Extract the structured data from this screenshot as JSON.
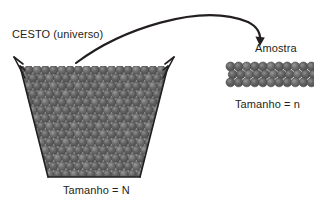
{
  "diagram": {
    "title_basket": "CESTO (universo)",
    "label_basket_size": "Tamanho = N",
    "title_sample": "Amostra",
    "label_sample_size": "Tamanho = n",
    "colors": {
      "background": "#ffffff",
      "outline": "#231f20",
      "text": "#231f20",
      "ball_dark": "#595959",
      "ball_mid": "#6e6e6e",
      "ball_light": "#8a8a8a",
      "ball_edge": "#4a4a4a",
      "highlight": "#ffffff"
    },
    "basket": {
      "shape": "trapezoid-basket",
      "top_left_x": 18,
      "top_right_x": 170,
      "bottom_left_x": 47,
      "bottom_right_x": 141,
      "top_y": 66,
      "bottom_y": 178,
      "handle": "two-angled-rim-handles",
      "ball_rows": 14,
      "ball_columns_top": 17,
      "ball_diameter": 9
    },
    "sample": {
      "shape": "rectangular-ball-block",
      "left_x": 226,
      "top_y": 62,
      "rows": 3,
      "columns": 11,
      "ball_diameter": 9
    },
    "arrow": {
      "type": "curved-arrow",
      "from": "basket-rim",
      "to": "sample-block",
      "start_x": 78,
      "start_y": 62,
      "end_x": 262,
      "end_y": 44,
      "arrowhead": "down-right"
    }
  }
}
